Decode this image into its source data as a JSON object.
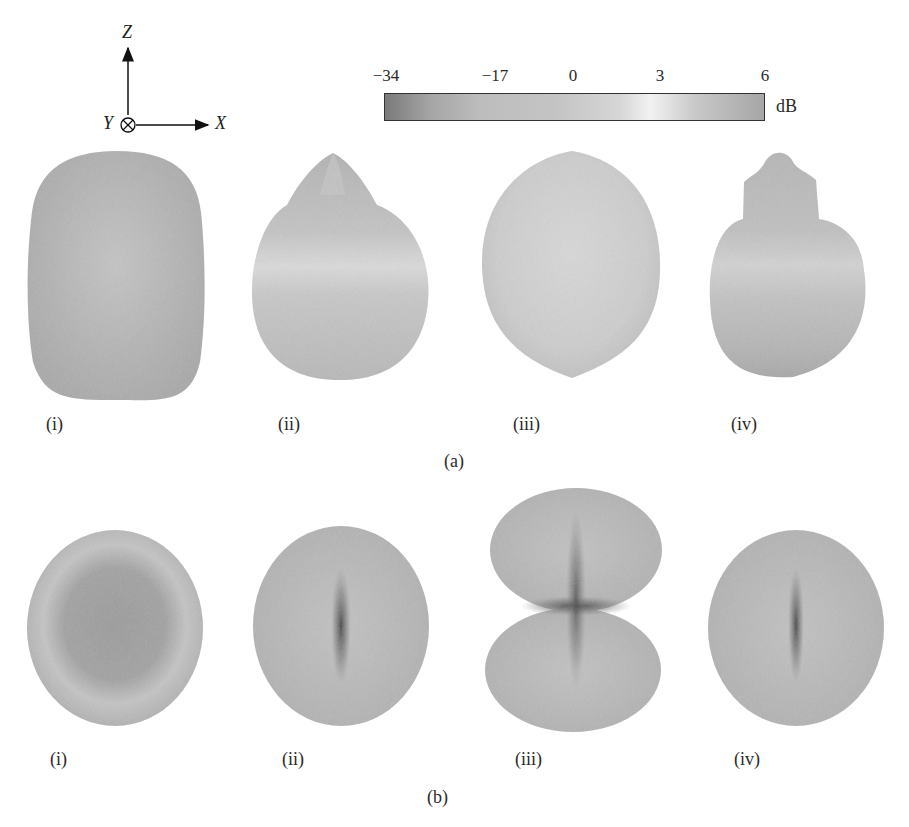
{
  "axes": {
    "z": "Z",
    "y": "Y",
    "x": "X"
  },
  "colorbar": {
    "ticks": [
      "−34",
      "−17",
      "0",
      "3",
      "6"
    ],
    "tick_positions": [
      384,
      495,
      573,
      660,
      765
    ],
    "unit": "dB",
    "colors": [
      "#7a7a7a",
      "#a5a5a5",
      "#c2c2c2",
      "#dcdcdc",
      "#f2f2f2",
      "#bdbdbd",
      "#a0a0a0"
    ]
  },
  "panels": {
    "a": {
      "caption": "(a)",
      "items": [
        {
          "label": "(i)"
        },
        {
          "label": "(ii)"
        },
        {
          "label": "(iii)"
        },
        {
          "label": "(iv)"
        }
      ]
    },
    "b": {
      "caption": "(b)",
      "items": [
        {
          "label": "(i)"
        },
        {
          "label": "(ii)"
        },
        {
          "label": "(iii)"
        },
        {
          "label": "(iv)"
        }
      ]
    }
  }
}
